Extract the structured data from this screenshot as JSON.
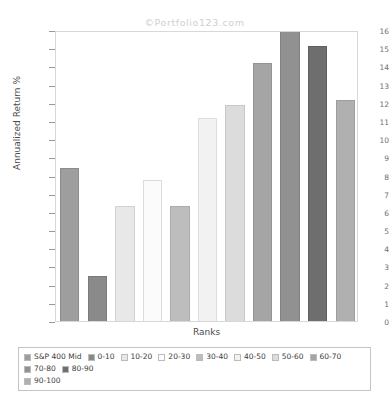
{
  "chart_data": {
    "type": "bar",
    "title": "©Portfolio123.com",
    "xlabel": "Ranks",
    "ylabel": "Annualized Return %",
    "ylim": [
      0,
      16
    ],
    "ytick_step": 1,
    "grid": false,
    "legend_position": "bottom",
    "categories": [
      "S&P 400 Mid",
      "0-10",
      "10-20",
      "20-30",
      "30-40",
      "40-50",
      "50-60",
      "60-70",
      "70-80",
      "80-90",
      "90-100"
    ],
    "values": [
      8.4,
      2.45,
      6.3,
      7.75,
      6.35,
      11.15,
      11.85,
      14.2,
      16.15,
      15.1,
      12.15
    ],
    "bar_colors": [
      "#9e9e9e",
      "#8a8a8a",
      "#e8e8e8",
      "#fbfbfb",
      "#bdbdbd",
      "#f2f2f2",
      "#dcdcdc",
      "#a5a5a5",
      "#919191",
      "#6e6e6e",
      "#b0b0b0"
    ],
    "bar_border_colors": [
      "#8c8c8c",
      "#7a7a7a",
      "#d2d2d2",
      "#dcdcdc",
      "#ababab",
      "#dedede",
      "#c8c8c8",
      "#949494",
      "#828282",
      "#5f5f5f",
      "#9e9e9e"
    ],
    "ytick_labels": [
      "0",
      "1",
      "2",
      "3",
      "4",
      "5",
      "6",
      "7",
      "8",
      "9",
      "10",
      "11",
      "12",
      "13",
      "14",
      "15",
      "16"
    ],
    "legend": [
      {
        "label": "S&P 400 Mid",
        "color": "#9e9e9e"
      },
      {
        "label": "0-10",
        "color": "#8a8a8a"
      },
      {
        "label": "10-20",
        "color": "#e8e8e8"
      },
      {
        "label": "20-30",
        "color": "#fbfbfb"
      },
      {
        "label": "30-40",
        "color": "#bdbdbd"
      },
      {
        "label": "40-50",
        "color": "#f2f2f2"
      },
      {
        "label": "50-60",
        "color": "#dcdcdc"
      },
      {
        "label": "60-70",
        "color": "#a5a5a5"
      },
      {
        "label": "70-80",
        "color": "#919191"
      },
      {
        "label": "80-90",
        "color": "#6e6e6e"
      },
      {
        "label": "90-100",
        "color": "#b0b0b0"
      }
    ]
  }
}
